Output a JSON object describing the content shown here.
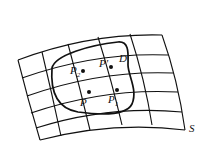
{
  "diagram": {
    "type": "surface-parametric-grid",
    "surface_label": "S",
    "region_label": "D",
    "points": [
      {
        "id": "P",
        "label": "P",
        "sub": ""
      },
      {
        "id": "P1",
        "label": "P",
        "sub": "1"
      },
      {
        "id": "P2",
        "label": "P",
        "sub": "2"
      },
      {
        "id": "Pprime",
        "label": "P'",
        "sub": ""
      }
    ],
    "colors": {
      "stroke": "#111111",
      "background": "#ffffff"
    }
  }
}
